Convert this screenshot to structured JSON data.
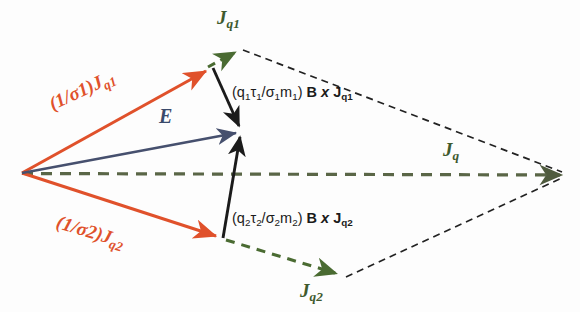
{
  "figure": {
    "background_color": "#fdfdfd"
  },
  "colors": {
    "orange": "#E0512B",
    "green": "#4A6B32",
    "dark_green": "#3F5A2E",
    "blue": "#3A4A6B",
    "black": "#1b1b1b",
    "olive_dash": "#5A6647"
  },
  "labels": {
    "sigma1_j1": "(1/σ1)J",
    "sigma1_j1_sub": "q1",
    "sigma2_j2": "(1/σ2)J",
    "sigma2_j2_sub": "q2",
    "efield": "E",
    "jq1": "J",
    "jq1_sub": "q1",
    "jq2": "J",
    "jq2_sub": "q2",
    "jq": "J",
    "jq_sub": "q",
    "cross1_prefix": "(q",
    "cross1": "(q1τ1/σ1m1) B x Jq1",
    "cross2": "(q2τ2/σ2m2) B x Jq2"
  },
  "vectors": [
    {
      "name": "one-over-sigma1-j-q1",
      "label": "(1/σ1)Jq1",
      "color": "#E0512B",
      "style": "solid",
      "from": [
        22,
        173
      ],
      "to": [
        212,
        68
      ]
    },
    {
      "name": "one-over-sigma2-j-q2",
      "label": "(1/σ2)Jq2",
      "color": "#E0512B",
      "style": "solid",
      "from": [
        22,
        173
      ],
      "to": [
        222,
        238
      ]
    },
    {
      "name": "electric-field",
      "label": "E",
      "color": "#3A4A6B",
      "style": "solid",
      "from": [
        22,
        173
      ],
      "to": [
        243,
        131
      ]
    },
    {
      "name": "b-cross-j-q1",
      "label": "(q1τ1/σ1m1) B x Jq1",
      "color": "#1b1b1b",
      "style": "solid",
      "from": [
        213,
        68
      ],
      "to": [
        241,
        130
      ]
    },
    {
      "name": "b-cross-j-q2",
      "label": "(q2τ2/σ2m2) B x Jq2",
      "color": "#1b1b1b",
      "style": "solid",
      "from": [
        223,
        238
      ],
      "to": [
        241,
        130
      ]
    },
    {
      "name": "j-q1-resultant",
      "label": "Jq1",
      "color": "#4A6B32",
      "style": "dashed",
      "from": [
        210,
        66
      ],
      "to": [
        240,
        50
      ]
    },
    {
      "name": "j-q2-resultant",
      "label": "Jq2",
      "color": "#4A6B32",
      "style": "dashed",
      "from": [
        224,
        239
      ],
      "to": [
        341,
        275
      ]
    },
    {
      "name": "j-q-total",
      "label": "Jq",
      "color": "#5A6647",
      "style": "dashed",
      "from": [
        22,
        173
      ],
      "to": [
        566,
        175
      ]
    }
  ],
  "construction_lines": [
    {
      "name": "construction-line-upper",
      "from": [
        242,
        50
      ],
      "to": [
        566,
        174
      ],
      "color": "#1b1b1b",
      "style": "dashed"
    },
    {
      "name": "construction-line-lower",
      "from": [
        344,
        276
      ],
      "to": [
        566,
        176
      ],
      "color": "#1b1b1b",
      "style": "dashed"
    }
  ]
}
